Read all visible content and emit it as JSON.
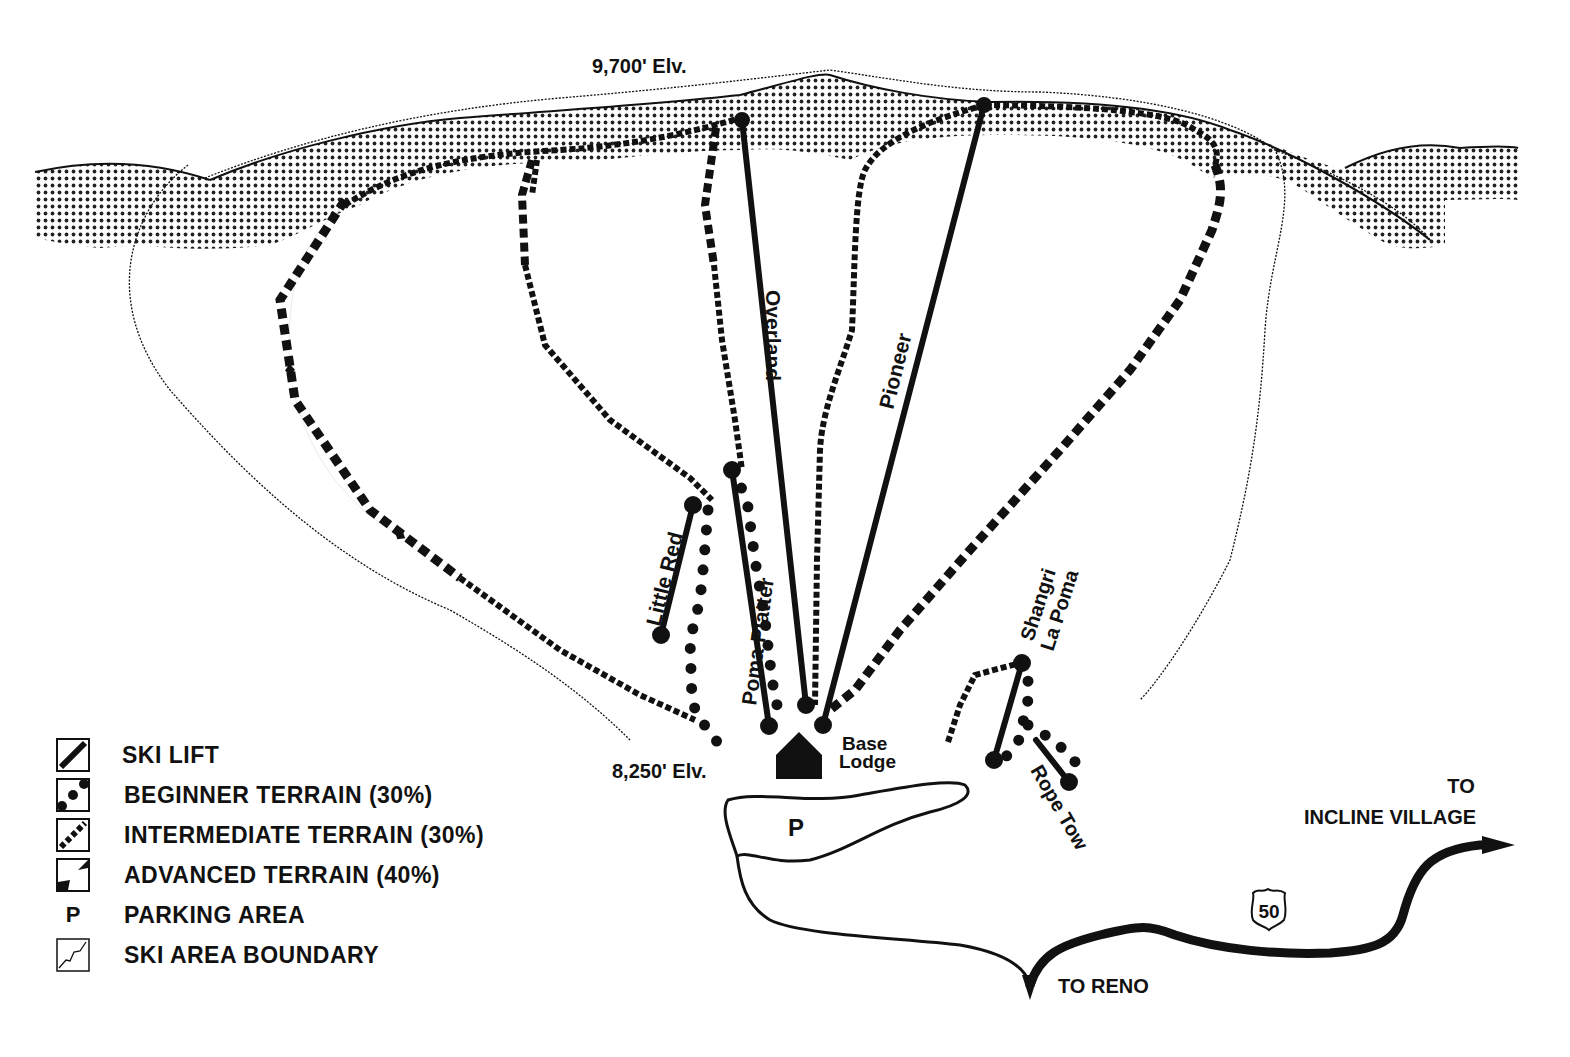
{
  "map": {
    "summit_elevation": "9,700' Elv.",
    "base_elevation": "8,250' Elv.",
    "base_lodge": [
      "Base",
      "Lodge"
    ],
    "parking_marker": "P",
    "lifts": [
      {
        "name": "Overland"
      },
      {
        "name": "Pioneer"
      },
      {
        "name": "Little Red"
      },
      {
        "name": "Poma Platter"
      },
      {
        "name": "Shangri La Poma",
        "lines": [
          "Shangri",
          "La Poma"
        ]
      },
      {
        "name": "Rope Tow"
      }
    ],
    "roads": {
      "highway_shield": "50",
      "to_north": [
        "TO",
        "INCLINE VILLAGE"
      ],
      "to_south": "TO RENO"
    },
    "colors": {
      "ink": "#111111",
      "paper": "#ffffff",
      "shade": "#222222"
    }
  },
  "legend": {
    "items": [
      {
        "icon": "ski-lift-icon",
        "label": "SKI LIFT"
      },
      {
        "icon": "beginner-terrain-icon",
        "label": "BEGINNER TERRAIN (30%)"
      },
      {
        "icon": "intermediate-terrain-icon",
        "label": "INTERMEDIATE TERRAIN (30%)"
      },
      {
        "icon": "advanced-terrain-icon",
        "label": "ADVANCED TERRAIN (40%)"
      },
      {
        "icon": "parking-icon",
        "label": "PARKING AREA",
        "symbol": "P"
      },
      {
        "icon": "boundary-icon",
        "label": "SKI AREA BOUNDARY"
      }
    ]
  }
}
